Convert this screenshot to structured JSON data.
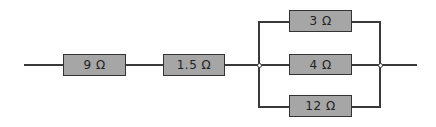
{
  "circuit": {
    "series": [
      {
        "label": "9 Ω",
        "value_ohms": 9
      },
      {
        "label": "1.5 Ω",
        "value_ohms": 1.5
      }
    ],
    "parallel": [
      {
        "label": "3 Ω",
        "value_ohms": 3
      },
      {
        "label": "4 Ω",
        "value_ohms": 4
      },
      {
        "label": "12 Ω",
        "value_ohms": 12
      }
    ]
  },
  "colors": {
    "resistor_fill": "#a6a6a6",
    "wire": "#3a3a3a",
    "background": "#ffffff"
  }
}
